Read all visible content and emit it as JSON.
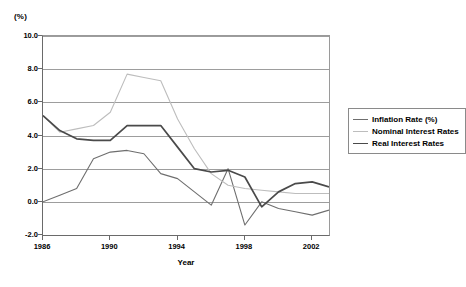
{
  "axis_unit_label": "(%)",
  "xaxis_title": "Year",
  "legend": {
    "items": [
      {
        "label": "Inflation Rate (%)",
        "color": "#6e6e6e",
        "width": 1.1
      },
      {
        "label": "Nominal Interest Rates",
        "color": "#bdbdbd",
        "width": 1.1
      },
      {
        "label": "Real Interest Rates",
        "color": "#4a4a4a",
        "width": 1.7
      }
    ]
  },
  "chart_data": {
    "type": "line",
    "title": "",
    "subtitle": "",
    "xlabel": "Year",
    "ylabel": "(%)",
    "xlim": [
      1986,
      2003
    ],
    "ylim": [
      -2.0,
      10.0
    ],
    "grid": true,
    "legend_position": "right",
    "ytick_labels": [
      "10.0",
      "8.0",
      "6.0",
      "4.0",
      "2.0",
      "0.0",
      "-2.0"
    ],
    "ytick_values": [
      10.0,
      8.0,
      6.0,
      4.0,
      2.0,
      0.0,
      -2.0
    ],
    "xtick_labels": [
      "1986",
      "1990",
      "1994",
      "1998",
      "2002"
    ],
    "xtick_values": [
      1986,
      1990,
      1994,
      1998,
      2002
    ],
    "x": [
      1986,
      1987,
      1988,
      1989,
      1990,
      1991,
      1992,
      1993,
      1994,
      1995,
      1996,
      1997,
      1998,
      1999,
      2000,
      2001,
      2002,
      2003
    ],
    "series": [
      {
        "name": "Inflation Rate (%)",
        "color": "#6e6e6e",
        "values": [
          0.0,
          0.4,
          0.8,
          2.6,
          3.0,
          3.1,
          2.9,
          1.7,
          1.4,
          0.6,
          -0.2,
          2.0,
          -1.4,
          0.0,
          -0.4,
          -0.6,
          -0.8,
          -0.5
        ]
      },
      {
        "name": "Nominal Interest Rates",
        "color": "#bdbdbd",
        "values": [
          5.2,
          4.2,
          4.4,
          4.6,
          5.4,
          7.7,
          7.5,
          7.3,
          5.0,
          3.2,
          1.7,
          1.0,
          0.8,
          0.7,
          0.6,
          0.5,
          0.5,
          0.5
        ]
      },
      {
        "name": "Real Interest Rates",
        "color": "#4a4a4a",
        "values": [
          5.2,
          4.3,
          3.8,
          3.7,
          3.7,
          4.6,
          4.6,
          4.6,
          3.3,
          2.0,
          1.8,
          1.9,
          1.5,
          -0.3,
          0.6,
          1.1,
          1.2,
          0.9
        ]
      }
    ]
  }
}
